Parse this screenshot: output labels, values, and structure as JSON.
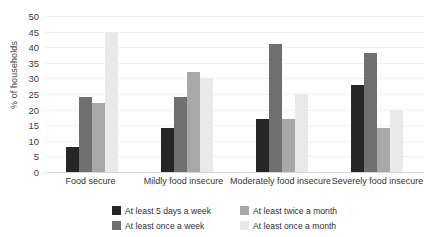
{
  "chart_data": {
    "type": "bar",
    "title": "",
    "subtitle": "",
    "xlabel": "",
    "ylabel": "% of households",
    "ylim": [
      0,
      50
    ],
    "ytick_step": 5,
    "yticks": [
      0,
      5,
      10,
      15,
      20,
      25,
      30,
      35,
      40,
      45,
      50
    ],
    "grid": true,
    "legend_position": "bottom",
    "categories": [
      "Food secure",
      "Mildly food insecure",
      "Moderately food insecure",
      "Severely food insecure"
    ],
    "series": [
      {
        "name": "At least 5 days a week",
        "color": "#262626",
        "values": [
          8,
          14,
          17,
          28
        ]
      },
      {
        "name": "At least once a week",
        "color": "#6f6f6f",
        "values": [
          24,
          24,
          41,
          38
        ]
      },
      {
        "name": "At least twice a month",
        "color": "#a8a8a8",
        "values": [
          22,
          32,
          17,
          14
        ]
      },
      {
        "name": "At least once a month",
        "color": "#e9e9e9",
        "values": [
          45,
          30,
          25,
          20
        ]
      }
    ]
  },
  "axis": {
    "y_title": "% of households",
    "y_tick_labels": [
      "50",
      "45",
      "40",
      "35",
      "30",
      "25",
      "20",
      "15",
      "10",
      "5",
      "0"
    ]
  },
  "legend": {
    "items": [
      {
        "label": "At least 5 days a week",
        "color": "#262626"
      },
      {
        "label": "At least twice a month",
        "color": "#a8a8a8"
      },
      {
        "label": "At least once a week",
        "color": "#6f6f6f"
      },
      {
        "label": "At least once a month",
        "color": "#e9e9e9"
      }
    ]
  }
}
